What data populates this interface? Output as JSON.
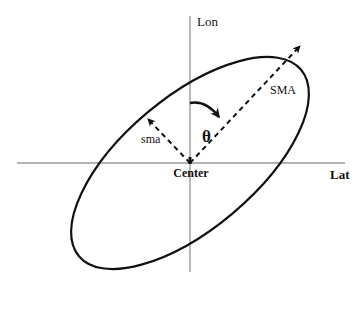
{
  "figure": {
    "type": "diagram",
    "background_color": "#ffffff",
    "stroke_color": "#111111",
    "axis_color": "#9a9a9a"
  },
  "axes": {
    "vertical": {
      "label": "Lon",
      "x": 190,
      "y_top": 16,
      "y_bottom": 272
    },
    "horizontal": {
      "label": "Lat",
      "y": 163,
      "x_left": 17,
      "x_right": 345
    }
  },
  "labels": {
    "lon": "Lon",
    "lat": "Lat",
    "sma_major": "SMA",
    "sma_minor": "sma",
    "center": "Center",
    "theta": "θ"
  },
  "ellipse": {
    "center_x": 190,
    "center_y": 163,
    "semi_major": 145,
    "semi_minor": 66,
    "rotation_deg": -40,
    "stroke_width": 2.2,
    "fill": "none"
  },
  "vectors": [
    {
      "name": "semi-major-axis-arrow",
      "label": "SMA",
      "from_x": 190,
      "from_y": 163,
      "to_x": 303,
      "to_y": 43,
      "style": "dashed",
      "arrowhead": true
    },
    {
      "name": "semi-minor-axis-arrow",
      "label": "sma",
      "from_x": 190,
      "from_y": 163,
      "to_x": 146,
      "to_y": 116,
      "style": "dashed",
      "arrowhead": true
    }
  ],
  "angle_arc": {
    "name": "theta-arc",
    "label": "θ",
    "from_x": 190,
    "from_y": 104,
    "to_x": 222,
    "to_y": 121,
    "arrowhead": true,
    "meaning": "angle from Lon axis to semi-major axis"
  }
}
